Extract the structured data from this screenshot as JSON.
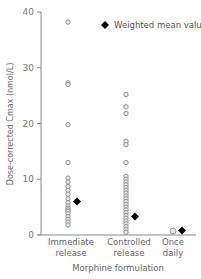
{
  "chart_data": {
    "type": "scatter",
    "title": "",
    "xlabel": "Morphine formulation",
    "ylabel": "Dose-corrected Cmax (nmol/L)",
    "ylim": [
      0,
      40
    ],
    "yticks": [
      0,
      10,
      20,
      30,
      40
    ],
    "grid": false,
    "legend_position": "top-right",
    "categories": [
      "Immediate release",
      "Controlled release",
      "Once daily"
    ],
    "category_lines": [
      [
        "Immediate",
        "release"
      ],
      [
        "Controlled",
        "release"
      ],
      [
        "Once",
        "daily"
      ]
    ],
    "series": [
      {
        "name": "Individual values",
        "marker": "open-circle",
        "values": [
          [
            38.2,
            27.3,
            27.0,
            19.8,
            13.0,
            10.2,
            9.5,
            8.7,
            8.0,
            7.3,
            6.5,
            5.8,
            5.2,
            4.8,
            4.5,
            4.2,
            3.8,
            3.3,
            2.8,
            2.3,
            1.8
          ],
          [
            25.2,
            23.0,
            21.8,
            16.8,
            16.2,
            13.0,
            10.5,
            10.0,
            9.5,
            9.0,
            8.5,
            8.0,
            7.5,
            7.0,
            6.5,
            6.0,
            5.5,
            5.0,
            4.5,
            4.0,
            3.5,
            3.0,
            2.5,
            2.0,
            1.5,
            1.0,
            0.5
          ],
          [
            0.7
          ]
        ]
      },
      {
        "name": "Weighted mean value",
        "marker": "filled-diamond",
        "values": [
          6.0,
          3.3,
          0.8
        ]
      }
    ]
  },
  "legend": {
    "items": [
      {
        "label": "Weighted mean value",
        "icon": "filled-diamond"
      }
    ]
  },
  "axes": {
    "y_tick_labels": [
      "0",
      "10",
      "20",
      "30",
      "40"
    ]
  },
  "colors": {
    "axis": "#888888",
    "circle_stroke": "#8a8a8a",
    "circle_fill": "#e6e6e6",
    "diamond": "#000000"
  }
}
